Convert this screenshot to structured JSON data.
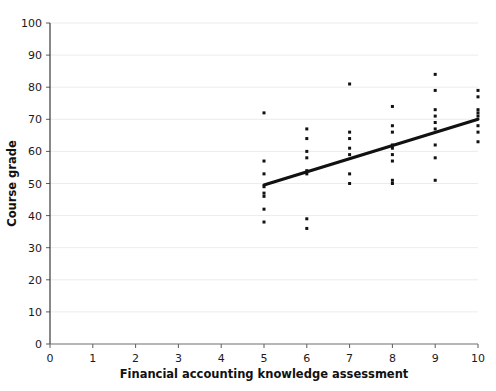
{
  "chart_data": {
    "type": "scatter",
    "title": "",
    "xlabel": "Financial accounting knowledge assessment",
    "ylabel": "Course grade",
    "xlim": [
      0,
      10
    ],
    "ylim": [
      0,
      100
    ],
    "xticks": [
      0,
      1,
      2,
      3,
      4,
      5,
      6,
      7,
      8,
      9,
      10
    ],
    "yticks": [
      0,
      10,
      20,
      30,
      40,
      50,
      60,
      70,
      80,
      90,
      100
    ],
    "xtick_labels": [
      "0",
      "1",
      "2",
      "3",
      "4",
      "5",
      "6",
      "7",
      "8",
      "9",
      "10"
    ],
    "ytick_labels": [
      "0",
      "10",
      "20",
      "30",
      "40",
      "50",
      "60",
      "70",
      "80",
      "90",
      "100"
    ],
    "grid": true,
    "grid_axis": "y",
    "legend": false,
    "point_color": "#111111",
    "grid_color": "#ececec",
    "axis_color": "#3a3a3a",
    "marker": "square",
    "marker_size": 3,
    "points": [
      {
        "x": 5,
        "y": 72
      },
      {
        "x": 5,
        "y": 57
      },
      {
        "x": 5,
        "y": 53
      },
      {
        "x": 5,
        "y": 49
      },
      {
        "x": 5,
        "y": 47
      },
      {
        "x": 5,
        "y": 46
      },
      {
        "x": 5,
        "y": 42
      },
      {
        "x": 5,
        "y": 38
      },
      {
        "x": 6,
        "y": 67
      },
      {
        "x": 6,
        "y": 64
      },
      {
        "x": 6,
        "y": 60
      },
      {
        "x": 6,
        "y": 58
      },
      {
        "x": 6,
        "y": 54
      },
      {
        "x": 6,
        "y": 53
      },
      {
        "x": 6,
        "y": 39
      },
      {
        "x": 6,
        "y": 36
      },
      {
        "x": 7,
        "y": 81
      },
      {
        "x": 7,
        "y": 66
      },
      {
        "x": 7,
        "y": 64
      },
      {
        "x": 7,
        "y": 61
      },
      {
        "x": 7,
        "y": 59
      },
      {
        "x": 7,
        "y": 53
      },
      {
        "x": 7,
        "y": 50
      },
      {
        "x": 8,
        "y": 74
      },
      {
        "x": 8,
        "y": 68
      },
      {
        "x": 8,
        "y": 66
      },
      {
        "x": 8,
        "y": 62
      },
      {
        "x": 8,
        "y": 61
      },
      {
        "x": 8,
        "y": 59
      },
      {
        "x": 8,
        "y": 57
      },
      {
        "x": 8,
        "y": 51
      },
      {
        "x": 8,
        "y": 50
      },
      {
        "x": 9,
        "y": 84
      },
      {
        "x": 9,
        "y": 79
      },
      {
        "x": 9,
        "y": 73
      },
      {
        "x": 9,
        "y": 71
      },
      {
        "x": 9,
        "y": 69
      },
      {
        "x": 9,
        "y": 67
      },
      {
        "x": 9,
        "y": 62
      },
      {
        "x": 9,
        "y": 58
      },
      {
        "x": 9,
        "y": 51
      },
      {
        "x": 10,
        "y": 79
      },
      {
        "x": 10,
        "y": 77
      },
      {
        "x": 10,
        "y": 73
      },
      {
        "x": 10,
        "y": 72
      },
      {
        "x": 10,
        "y": 71
      },
      {
        "x": 10,
        "y": 68
      },
      {
        "x": 10,
        "y": 66
      },
      {
        "x": 10,
        "y": 63
      }
    ],
    "trendline": {
      "x_start": 5,
      "y_start": 49.5,
      "x_end": 10,
      "y_end": 70,
      "color": "#111111",
      "width": 3
    }
  }
}
